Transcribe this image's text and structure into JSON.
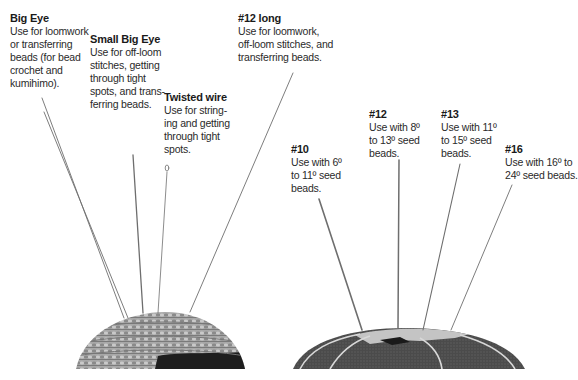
{
  "needle_labels": [
    {
      "id": "big-eye",
      "title": "Big Eye",
      "desc": "Use for loomwork\nor transferring\nbeads (for bead\ncrochet and\nkumihimo)."
    },
    {
      "id": "small-big-eye",
      "title": "Small Big Eye",
      "desc": "Use for off-loom\nstitches, getting\nthrough tight\nspots, and trans-\nferring beads."
    },
    {
      "id": "twisted-wire",
      "title": "Twisted wire",
      "desc": "Use for string-\ning and getting\nthrough tight\nspots."
    },
    {
      "id": "12-long",
      "title": "#12 long",
      "desc": "Use for loomwork,\noff-loom stitches, and\ntransferring beads."
    },
    {
      "id": "10",
      "title": "#10",
      "desc": "Use with 6º\nto 11º seed\nbeads."
    },
    {
      "id": "12",
      "title": "#12",
      "desc": "Use with 8º\nto 13º seed\nbeads."
    },
    {
      "id": "13",
      "title": "#13",
      "desc": "Use with 11º\nto 15º seed\nbeads."
    },
    {
      "id": "16",
      "title": "#16",
      "desc": "Use with 16º to\n24º seed beads."
    }
  ],
  "colors": {
    "text": "#231f20",
    "crochet_cushion": "#9a9a9a",
    "crochet_dark_patch": "#1e1e1e",
    "felt_cushion": "#4a4a4a",
    "felt_stripe": "#d8d8d8",
    "needle": "#6e6e6e"
  }
}
